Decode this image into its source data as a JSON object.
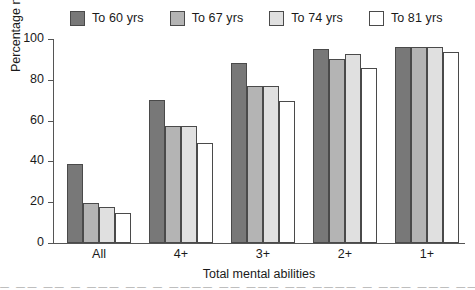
{
  "chart_data": {
    "type": "bar",
    "title": "",
    "xlabel": "Total mental abilities",
    "ylabel": "Percentage maintenance over 7 years",
    "categories": [
      "All",
      "4+",
      "3+",
      "2+",
      "1+"
    ],
    "ylim": [
      0,
      100
    ],
    "yticks": [
      0,
      20,
      40,
      60,
      80,
      100
    ],
    "ytick_labels": [
      "0",
      "20",
      "40",
      "60",
      "80",
      "100"
    ],
    "grid": false,
    "legend_position": "top",
    "series": [
      {
        "name": "To 60 yrs",
        "color": "#787878",
        "values": [
          38.5,
          70.0,
          88.0,
          95.0,
          96.0
        ]
      },
      {
        "name": "To 67 yrs",
        "color": "#b4b4b4",
        "values": [
          19.5,
          57.5,
          77.0,
          90.0,
          96.0
        ]
      },
      {
        "name": "To 74 yrs",
        "color": "#e0e0e0",
        "values": [
          17.5,
          57.5,
          77.0,
          92.5,
          96.0
        ]
      },
      {
        "name": "To 81 yrs",
        "color": "#ffffff",
        "values": [
          14.5,
          49.0,
          69.5,
          86.0,
          93.5
        ]
      }
    ]
  },
  "footer": {
    "cropped_text": "— —— —— — ——— —— — ———— —— ——— —— ———— — ——— ——— ——"
  }
}
